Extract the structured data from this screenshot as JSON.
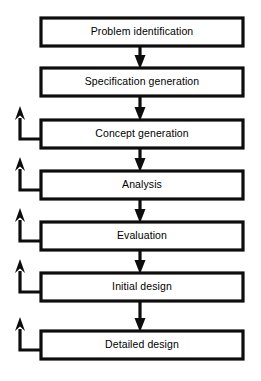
{
  "diagram": {
    "type": "linear-flowchart-with-feedback",
    "orientation": "vertical",
    "colors": {
      "stroke": "#0d0d0d",
      "box_fill": "#ffffff",
      "text": "#000000",
      "background": "#ffffff"
    },
    "layout": {
      "box_left": 41,
      "box_right": 243,
      "box_width": 202,
      "box_height": 28,
      "box_center_x": 142,
      "first_box_top": 18,
      "row_spacing": 50,
      "down_arrow_x": 140,
      "feedback_rail_x": 20
    },
    "stages": [
      {
        "index": 1,
        "label": "Problem identification",
        "box_top": 18,
        "has_feedback_arrow": false
      },
      {
        "index": 2,
        "label": "Specification generation",
        "box_top": 68,
        "has_feedback_arrow": false
      },
      {
        "index": 3,
        "label": "Concept generation",
        "box_top": 120,
        "has_feedback_arrow": true
      },
      {
        "index": 4,
        "label": "Analysis",
        "box_top": 171,
        "has_feedback_arrow": true
      },
      {
        "index": 5,
        "label": "Evaluation",
        "box_top": 222,
        "has_feedback_arrow": true
      },
      {
        "index": 6,
        "label": "Initial design",
        "box_top": 273,
        "has_feedback_arrow": true
      },
      {
        "index": 7,
        "label": "Detailed design",
        "box_top": 331,
        "has_feedback_arrow": true
      }
    ],
    "connectors": [
      {
        "from": 1,
        "to": 2,
        "kind": "down-arrow"
      },
      {
        "from": 2,
        "to": 3,
        "kind": "down-arrow"
      },
      {
        "from": 3,
        "to": 4,
        "kind": "down-arrow"
      },
      {
        "from": 4,
        "to": 5,
        "kind": "down-arrow"
      },
      {
        "from": 5,
        "to": 6,
        "kind": "down-arrow"
      },
      {
        "from": 6,
        "to": 7,
        "kind": "down-arrow"
      }
    ],
    "feedback_arrows": [
      {
        "from_stage": 3,
        "direction": "up-left",
        "label": ""
      },
      {
        "from_stage": 4,
        "direction": "up-left",
        "label": ""
      },
      {
        "from_stage": 5,
        "direction": "up-left",
        "label": ""
      },
      {
        "from_stage": 6,
        "direction": "up-left",
        "label": ""
      },
      {
        "from_stage": 7,
        "direction": "up-left",
        "label": ""
      }
    ]
  }
}
